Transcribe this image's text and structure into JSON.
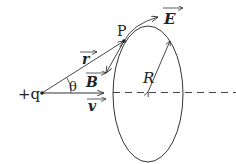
{
  "diagram": {
    "charge_label": "+q",
    "point_label": "P",
    "angle_label": "θ",
    "radius_label": "R",
    "vectors": {
      "r": "r",
      "v": "v",
      "B": "B",
      "E": "E"
    },
    "colors": {
      "line": "#333333",
      "dash": "#444444",
      "background": "#ffffff"
    }
  }
}
